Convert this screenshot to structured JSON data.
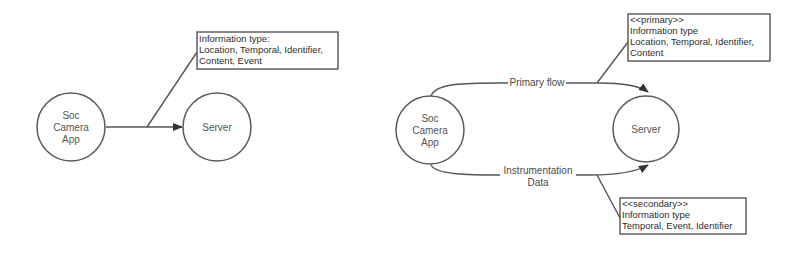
{
  "diagrams": [
    {
      "name": "simple-flow",
      "nodes": {
        "source": [
          "Soc",
          "Camera",
          "App"
        ],
        "target": [
          "Server"
        ]
      },
      "note": {
        "lines": [
          "Information type:",
          "Location, Temporal, Identifier,",
          "Content, Event"
        ]
      }
    },
    {
      "name": "split-flow",
      "nodes": {
        "source": [
          "Soc",
          "Camera",
          "App"
        ],
        "target": [
          "Server"
        ]
      },
      "flows": {
        "primary": {
          "label": [
            "Primary flow"
          ]
        },
        "secondary": {
          "label": [
            "Instrumentation",
            "Data"
          ]
        }
      },
      "notes": {
        "primary": {
          "lines": [
            "<<primary>>",
            "Information type",
            "Location, Temporal, Identifier,",
            "Content"
          ]
        },
        "secondary": {
          "lines": [
            "<<secondary>>",
            "Information type",
            "Temporal, Event, Identifier"
          ]
        }
      }
    }
  ],
  "colors": {
    "line": "#555555",
    "text": "#3a3a3a",
    "background": "#ffffff"
  }
}
